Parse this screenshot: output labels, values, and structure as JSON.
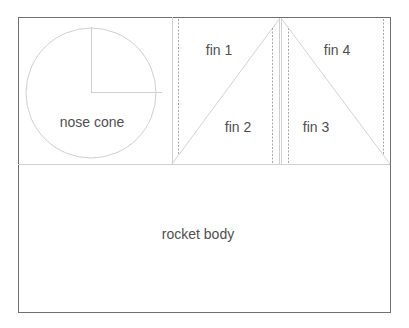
{
  "diagram": {
    "type": "rocket-template",
    "colors": {
      "outline": "#707070",
      "guide": "#d0d0d0",
      "dashed": "#a8a8a8",
      "text": "#505050",
      "background": "#ffffff"
    },
    "labels": {
      "nose_cone": "nose cone",
      "fin1": "fin 1",
      "fin2": "fin 2",
      "fin3": "fin 3",
      "fin4": "fin 4",
      "rocket_body": "rocket body"
    },
    "regions": [
      {
        "name": "nose cone",
        "shape": "circle"
      },
      {
        "name": "fin 1",
        "shape": "triangle"
      },
      {
        "name": "fin 2",
        "shape": "triangle"
      },
      {
        "name": "fin 3",
        "shape": "triangle"
      },
      {
        "name": "fin 4",
        "shape": "triangle"
      },
      {
        "name": "rocket body",
        "shape": "rectangle"
      }
    ]
  }
}
